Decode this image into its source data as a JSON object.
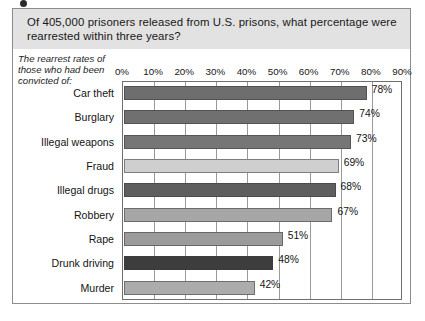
{
  "figure": {
    "title": "Of 405,000 prisoners released from U.S. prisons, what percentage were rearrested within three years?",
    "caption": "The rearrest rates of those who had been convicted of:"
  },
  "chart_data": {
    "type": "bar",
    "orientation": "horizontal",
    "title": "Of 405,000 prisoners released from U.S. prisons, what percentage were rearrested within three years?",
    "subtitle": "The rearrest rates of those who had been convicted of:",
    "xlabel": "",
    "ylabel": "",
    "xlim": [
      0,
      90
    ],
    "grid": true,
    "legend": "none",
    "unit": "%",
    "tick_labels": [
      "0%",
      "10%",
      "20%",
      "30%",
      "40%",
      "50%",
      "60%",
      "70%",
      "80%",
      "90%"
    ],
    "tick_values": [
      0,
      10,
      20,
      30,
      40,
      50,
      60,
      70,
      80,
      90
    ],
    "categories": [
      "Car theft",
      "Burglary",
      "Illegal weapons",
      "Fraud",
      "Illegal drugs",
      "Robbery",
      "Rape",
      "Drunk driving",
      "Murder"
    ],
    "values": [
      78,
      74,
      73,
      69,
      68,
      67,
      51,
      48,
      42
    ],
    "value_labels": [
      "78%",
      "74%",
      "73%",
      "69%",
      "68%",
      "67%",
      "51%",
      "48%",
      "42%"
    ],
    "bar_colors": [
      "#6e6e6e",
      "#707070",
      "#767676",
      "#cfcfcf",
      "#5e5e5e",
      "#a6a6a6",
      "#9b9b9b",
      "#3d3d3d",
      "#acacac"
    ]
  },
  "colors": {
    "title_band": "#e2e2e2",
    "frame": "#8d8d8d",
    "gridline": "#9a9a9a",
    "text": "#171717"
  }
}
